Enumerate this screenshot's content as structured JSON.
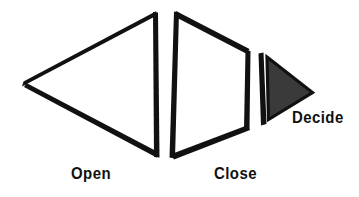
{
  "figure": {
    "background_color": "#ffffff",
    "stroke_color": "#111111",
    "fill_color": "#3a3a3a",
    "shapes": [
      {
        "name": "open-triangle",
        "kind": "triangle-outline",
        "direction": "left",
        "fill": "none",
        "stroke": "#111111",
        "label": "Open",
        "points": "155,12 24,84 155,157"
      },
      {
        "name": "close-trapezoid",
        "kind": "trapezoid-outline",
        "direction": "right-narrowing",
        "fill": "none",
        "stroke": "#111111",
        "label": "Close",
        "points": "176,12 248,51 247,128 172,158"
      },
      {
        "name": "decide-triangle",
        "kind": "triangle-filled",
        "direction": "right",
        "fill": "#3a3a3a",
        "stroke": "#111111",
        "label": "Decide",
        "points": "264,57 311,92 266,120"
      }
    ]
  },
  "labels": {
    "open": "Open",
    "close": "Close",
    "decide": "Decide"
  }
}
